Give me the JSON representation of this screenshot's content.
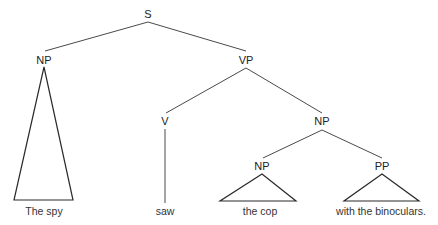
{
  "diagram": {
    "type": "syntax-tree",
    "nodes": {
      "s": "S",
      "np_subject": "NP",
      "vp": "VP",
      "v": "V",
      "np_object": "NP",
      "np_inner": "NP",
      "pp": "PP"
    },
    "leaves": {
      "np_subject": "The spy",
      "v": "saw",
      "np_inner": "the cop",
      "pp": "with the binoculars."
    },
    "colors": {
      "line": "#4a4a4a",
      "text": "#222222",
      "background": "#ffffff"
    }
  }
}
